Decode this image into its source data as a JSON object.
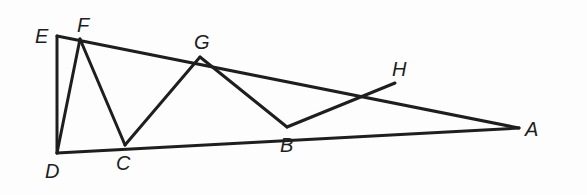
{
  "figure": {
    "type": "geometry-diagram",
    "stroke_color": "#1e1e1e",
    "points": {
      "A": {
        "label": "A",
        "x": 519,
        "y": 128,
        "label_x": 525,
        "label_y": 136
      },
      "B": {
        "label": "B",
        "x": 287,
        "y": 127,
        "label_x": 280,
        "label_y": 152
      },
      "C": {
        "label": "C",
        "x": 125,
        "y": 145,
        "label_x": 116,
        "label_y": 170
      },
      "D": {
        "label": "D",
        "x": 57,
        "y": 153,
        "label_x": 45,
        "label_y": 178
      },
      "E": {
        "label": "E",
        "x": 57,
        "y": 36,
        "label_x": 35,
        "label_y": 43
      },
      "F": {
        "label": "F",
        "x": 80,
        "y": 39,
        "label_x": 77,
        "label_y": 32
      },
      "G": {
        "label": "G",
        "x": 200,
        "y": 57,
        "label_x": 194,
        "label_y": 49
      },
      "H": {
        "label": "H",
        "x": 395,
        "y": 83,
        "label_x": 392,
        "label_y": 76
      }
    },
    "segments": [
      [
        "E",
        "A"
      ],
      [
        "D",
        "A"
      ],
      [
        "E",
        "D"
      ],
      [
        "D",
        "F"
      ],
      [
        "F",
        "C"
      ],
      [
        "C",
        "G"
      ],
      [
        "G",
        "B"
      ],
      [
        "B",
        "H"
      ]
    ],
    "labels": [
      "A",
      "B",
      "C",
      "D",
      "E",
      "F",
      "G",
      "H"
    ]
  }
}
